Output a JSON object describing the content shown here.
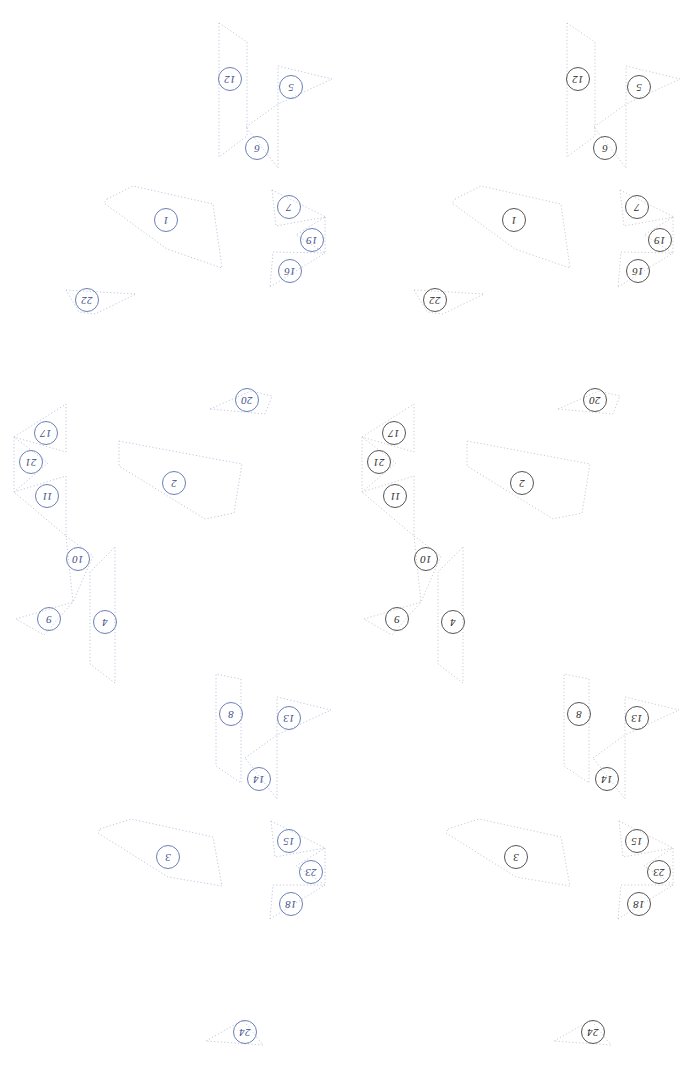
{
  "canvas": {
    "width": 696,
    "height": 1067,
    "background": "#ffffff"
  },
  "panels": [
    {
      "id": "left-panel",
      "variant": "blue",
      "offset_x": 0,
      "stroke": "#aab4d2",
      "label_color": "#3a4f8a",
      "label_ring": "#6b7fb5"
    },
    {
      "id": "right-panel",
      "variant": "gray",
      "offset_x": 348,
      "stroke": "#b9b9b9",
      "label_color": "#2b2b2b",
      "label_ring": "#555555"
    }
  ],
  "line_style": {
    "dash": "1.2 2.2",
    "width": 0.75
  },
  "pieces": [
    {
      "id": 1,
      "label": "1",
      "label_x": 165,
      "label_y": 219,
      "rotation": 200,
      "points": "107,199 133,186 213,204 222,268 167,249 104,203"
    },
    {
      "id": 2,
      "label": "2",
      "label_x": 173,
      "label_y": 482,
      "rotation": 200,
      "points": "119,441 242,464 234,513 205,519 119,466"
    },
    {
      "id": 3,
      "label": "3",
      "label_x": 167,
      "label_y": 856,
      "rotation": 200,
      "points": "100,829 131,819 213,837 222,886 168,877 98,833"
    },
    {
      "id": 4,
      "label": "4",
      "label_x": 104,
      "label_y": 621,
      "rotation": 200,
      "points": "115,547 115,683 90,664 90,572"
    },
    {
      "id": 5,
      "label": "5",
      "label_x": 290,
      "label_y": 86,
      "rotation": 200,
      "points": "278,66 332,79 278,104"
    },
    {
      "id": 6,
      "label": "6",
      "label_x": 256,
      "label_y": 147,
      "rotation": 200,
      "points": "246,127 278,104 278,168"
    },
    {
      "id": 7,
      "label": "7",
      "label_x": 288,
      "label_y": 206,
      "rotation": 200,
      "points": "272,190 326,217 276,226"
    },
    {
      "id": 8,
      "label": "8",
      "label_x": 230,
      "label_y": 713,
      "rotation": 200,
      "points": "241,679 241,783 216,766 216,674"
    },
    {
      "id": 9,
      "label": "9",
      "label_x": 48,
      "label_y": 618,
      "rotation": 200,
      "points": "16,619 73,602 44,635"
    },
    {
      "id": 10,
      "label": "10",
      "label_x": 77,
      "label_y": 558,
      "rotation": 200,
      "points": "66,536 93,556 73,602"
    },
    {
      "id": 11,
      "label": "11",
      "label_x": 46,
      "label_y": 495,
      "rotation": 200,
      "points": "14,492 66,476 66,536"
    },
    {
      "id": 12,
      "label": "12",
      "label_x": 229,
      "label_y": 78,
      "rotation": 200,
      "points": "219,23 247,42 247,136 219,157"
    },
    {
      "id": 13,
      "label": "13",
      "label_x": 288,
      "label_y": 717,
      "rotation": 200,
      "points": "277,697 331,710 277,735"
    },
    {
      "id": 14,
      "label": "14",
      "label_x": 258,
      "label_y": 778,
      "rotation": 200,
      "points": "245,758 277,735 277,799"
    },
    {
      "id": 15,
      "label": "15",
      "label_x": 288,
      "label_y": 840,
      "rotation": 200,
      "points": "271,821 325,848 275,857"
    },
    {
      "id": 16,
      "label": "16",
      "label_x": 289,
      "label_y": 270,
      "rotation": 200,
      "points": "270,287 325,253 273,252"
    },
    {
      "id": 17,
      "label": "17",
      "label_x": 45,
      "label_y": 432,
      "rotation": 200,
      "points": "14,437 66,404 66,452"
    },
    {
      "id": 18,
      "label": "18",
      "label_x": 290,
      "label_y": 903,
      "rotation": 200,
      "points": "270,919 325,885 273,885"
    },
    {
      "id": 19,
      "label": "19",
      "label_x": 311,
      "label_y": 239,
      "rotation": 200,
      "points": "325,217 325,253 296,235"
    },
    {
      "id": 20,
      "label": "20",
      "label_x": 246,
      "label_y": 399,
      "rotation": 200,
      "points": "210,409 251,391 272,396 265,414"
    },
    {
      "id": 21,
      "label": "21",
      "label_x": 30,
      "label_y": 461,
      "rotation": 200,
      "points": "14,437 14,492 48,463"
    },
    {
      "id": 22,
      "label": "22",
      "label_x": 86,
      "label_y": 299,
      "rotation": 200,
      "points": "66,290 136,294 95,314 79,312"
    },
    {
      "id": 23,
      "label": "23",
      "label_x": 310,
      "label_y": 871,
      "rotation": 200,
      "points": "325,848 325,885 296,866"
    },
    {
      "id": 24,
      "label": "24",
      "label_x": 244,
      "label_y": 1031,
      "rotation": 200,
      "points": "206,1041 243,1020 263,1045"
    }
  ]
}
